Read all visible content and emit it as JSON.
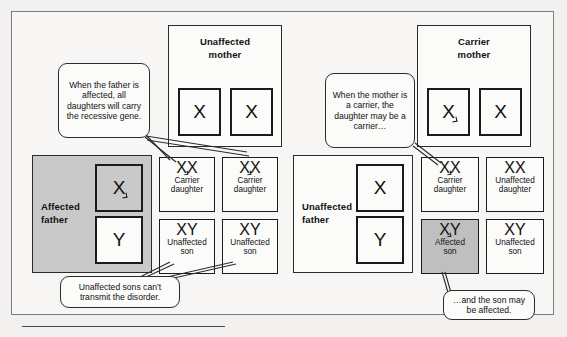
{
  "figure": {
    "bottom_rule": true
  },
  "left_cross": {
    "mother": {
      "title_line1": "Unaffected",
      "title_line2": "mother",
      "alleles": [
        {
          "label": "X",
          "mutant": false,
          "shaded": false
        },
        {
          "label": "X",
          "mutant": false,
          "shaded": false
        }
      ]
    },
    "father": {
      "title_line1": "Affected",
      "title_line2": "father",
      "shaded": true,
      "alleles": [
        {
          "label": "X",
          "mutant": true,
          "shaded": true
        },
        {
          "label": "Y",
          "mutant": false,
          "shaded": false
        }
      ]
    },
    "offspring": [
      {
        "genotype": "XX",
        "mutant_first": true,
        "line1": "Carrier",
        "line2": "daughter",
        "shaded": false
      },
      {
        "genotype": "XX",
        "mutant_first": true,
        "line1": "Carrier",
        "line2": "daughter",
        "shaded": false
      },
      {
        "genotype": "XY",
        "mutant_first": false,
        "line1": "Unaffected",
        "line2": "son",
        "shaded": false
      },
      {
        "genotype": "XY",
        "mutant_first": false,
        "line1": "Unaffected",
        "line2": "son",
        "shaded": false
      }
    ]
  },
  "right_cross": {
    "mother": {
      "title_line1": "Carrier",
      "title_line2": "mother",
      "alleles": [
        {
          "label": "X",
          "mutant": true,
          "shaded": false
        },
        {
          "label": "X",
          "mutant": false,
          "shaded": false
        }
      ]
    },
    "father": {
      "title_line1": "Unaffected",
      "title_line2": "father",
      "shaded": false,
      "alleles": [
        {
          "label": "X",
          "mutant": false,
          "shaded": false
        },
        {
          "label": "Y",
          "mutant": false,
          "shaded": false
        }
      ]
    },
    "offspring": [
      {
        "genotype": "XX",
        "mutant_first": true,
        "line1": "Carrier",
        "line2": "daughter",
        "shaded": false
      },
      {
        "genotype": "XX",
        "mutant_first": false,
        "line1": "Unaffected",
        "line2": "daughter",
        "shaded": false
      },
      {
        "genotype": "XY",
        "mutant_first": true,
        "line1": "Affected",
        "line2": "son",
        "shaded": true
      },
      {
        "genotype": "XY",
        "mutant_first": false,
        "line1": "Unaffected",
        "line2": "son",
        "shaded": false
      }
    ]
  },
  "callouts": {
    "father_affected": "When the father is affected, all daughters will carry the recessive gene.",
    "mother_carrier": "When the mother is a carrier, the daughter may be a carrier…",
    "sons_cannot_transmit": "Unaffected sons can’t transmit the disorder.",
    "son_may_be_affected": "…and the son may be affected."
  },
  "colors": {
    "page_background": "#f2f1ef",
    "frame_border": "#7d7d7d",
    "box_border": "#1b1b1b",
    "shaded_fill": "#c9c9c9",
    "result_shaded_fill": "#bfbfbf",
    "text": "#111111"
  }
}
